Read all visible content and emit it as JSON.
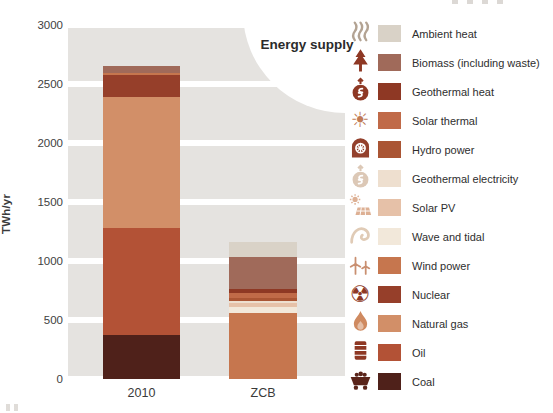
{
  "chart_data": {
    "type": "bar",
    "stacked": true,
    "title": "Energy supply",
    "ylabel": "TWh/yr",
    "unit": "TWh/yr",
    "ylim": [
      0,
      3000
    ],
    "yticks": [
      0,
      500,
      1000,
      1500,
      2000,
      2500,
      3000
    ],
    "grid": "banded-horizontal",
    "legend_position": "right",
    "categories": [
      "2010",
      "ZCB"
    ],
    "series": [
      {
        "name": "Coal",
        "values": [
          370,
          0
        ]
      },
      {
        "name": "Oil",
        "values": [
          910,
          0
        ]
      },
      {
        "name": "Natural gas",
        "values": [
          1110,
          0
        ]
      },
      {
        "name": "Nuclear",
        "values": [
          185,
          0
        ]
      },
      {
        "name": "Wind power",
        "values": [
          20,
          560
        ]
      },
      {
        "name": "Wave and tidal",
        "values": [
          0,
          50
        ]
      },
      {
        "name": "Solar PV",
        "values": [
          0,
          30
        ]
      },
      {
        "name": "Geothermal electricity",
        "values": [
          0,
          20
        ]
      },
      {
        "name": "Hydro power",
        "values": [
          0,
          25
        ]
      },
      {
        "name": "Solar thermal",
        "values": [
          0,
          45
        ]
      },
      {
        "name": "Geothermal heat",
        "values": [
          0,
          35
        ]
      },
      {
        "name": "Biomass (including waste)",
        "values": [
          60,
          265
        ]
      },
      {
        "name": "Ambient heat",
        "values": [
          0,
          130
        ]
      }
    ]
  },
  "legend": {
    "items": [
      {
        "label": "Ambient heat",
        "color": "#d9d2c7",
        "icon": "ambient-heat-icon",
        "icon_color": "#b3a393"
      },
      {
        "label": "Biomass (including waste)",
        "color": "#a06a5a",
        "icon": "biomass-icon",
        "icon_color": "#8e3824"
      },
      {
        "label": "Geothermal heat",
        "color": "#8e3824",
        "icon": "geothermal-heat-icon",
        "icon_color": "#8e3824"
      },
      {
        "label": "Solar thermal",
        "color": "#c06a48",
        "icon": "solar-thermal-icon",
        "icon_color": "#c07a55"
      },
      {
        "label": "Hydro power",
        "color": "#aa5534",
        "icon": "hydro-power-icon",
        "icon_color": "#93402c"
      },
      {
        "label": "Geothermal electricity",
        "color": "#eedfcf",
        "icon": "geothermal-electricity-icon",
        "icon_color": "#dcc8b6"
      },
      {
        "label": "Solar PV",
        "color": "#e6c1a8",
        "icon": "solar-pv-icon",
        "icon_color": "#ddb094"
      },
      {
        "label": "Wave and tidal",
        "color": "#f2e8da",
        "icon": "wave-tidal-icon",
        "icon_color": "#e0cbb6"
      },
      {
        "label": "Wind power",
        "color": "#c6764e",
        "icon": "wind-power-icon",
        "icon_color": "#c98f70"
      },
      {
        "label": "Nuclear",
        "color": "#963f2a",
        "icon": "nuclear-icon",
        "icon_color": "#8e3824"
      },
      {
        "label": "Natural gas",
        "color": "#d28f68",
        "icon": "natural-gas-icon",
        "icon_color": "#cf8a60"
      },
      {
        "label": "Oil",
        "color": "#b35236",
        "icon": "oil-icon",
        "icon_color": "#8e3824"
      },
      {
        "label": "Coal",
        "color": "#4f211a",
        "icon": "coal-icon",
        "icon_color": "#5a241a"
      }
    ]
  },
  "colors": {
    "background": "#ffffff",
    "grid_band": "#e5e3e0",
    "axis_text": "#3e3e3e",
    "title_text": "#2b2b2b"
  }
}
